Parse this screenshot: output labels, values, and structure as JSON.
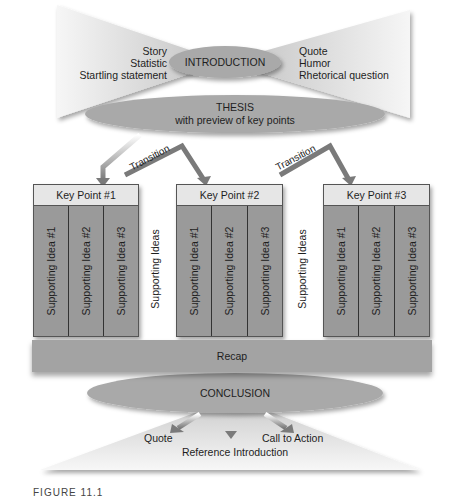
{
  "introduction": {
    "title": "INTRODUCTION",
    "left_items": [
      "Story",
      "Statistic",
      "Startling statement"
    ],
    "right_items": [
      "Quote",
      "Humor",
      "Rhetorical question"
    ]
  },
  "thesis": {
    "title": "THESIS",
    "subtitle": "with preview of key points"
  },
  "transitions": [
    "Transition",
    "Transition"
  ],
  "key_points": [
    {
      "title": "Key Point #1",
      "ideas": [
        "Supporting Idea #1",
        "Supporting Idea #2",
        "Supporting Idea #3"
      ]
    },
    {
      "title": "Key Point #2",
      "ideas": [
        "Supporting Idea #1",
        "Supporting Idea #2",
        "Supporting Idea #3"
      ]
    },
    {
      "title": "Key Point #3",
      "ideas": [
        "Supporting Idea #1",
        "Supporting Idea #2",
        "Supporting Idea #3"
      ]
    }
  ],
  "supporting_ideas_labels": [
    "Supporting Ideas",
    "Supporting Ideas"
  ],
  "recap": {
    "label": "Recap"
  },
  "conclusion": {
    "title": "CONCLUSION",
    "items": {
      "left": "Quote",
      "center": "Reference Introduction",
      "right": "Call to Action"
    }
  },
  "caption": "FIGURE 11.1",
  "colors": {
    "ellipse": "#a9a9a9",
    "box_body": "#9a9a9a",
    "box_header": "#e6e6e6",
    "arrow": "#7a7a7a",
    "funnel_light": "#f4f4f4",
    "funnel_dark": "#c4c4c4"
  }
}
